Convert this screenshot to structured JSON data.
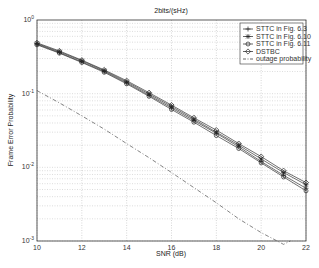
{
  "chart_data": {
    "type": "line",
    "title": "2bits/(sHz)",
    "xlabel": "SNR (dB)",
    "ylabel": "Frame Error Probability",
    "yscale": "log",
    "xlim": [
      10,
      22
    ],
    "ylim": [
      0.001,
      1
    ],
    "grid": true,
    "legend_position": "upper right",
    "x_ticks": [
      "10",
      "12",
      "14",
      "16",
      "18",
      "20",
      "22"
    ],
    "y_ticks": [
      "10^0",
      "10^-1",
      "10^-2",
      "10^-3"
    ],
    "x": [
      10,
      11,
      12,
      13,
      14,
      15,
      16,
      17,
      18,
      19,
      20,
      21,
      22
    ],
    "series": [
      {
        "name": "STTC in Fig. 6.3",
        "marker": "plus",
        "style": "solid",
        "values": [
          0.47,
          0.36,
          0.27,
          0.2,
          0.14,
          0.095,
          0.064,
          0.043,
          0.029,
          0.019,
          0.012,
          0.0078,
          0.0052
        ]
      },
      {
        "name": "STTC in Fig. 6.10",
        "marker": "star",
        "style": "solid",
        "values": [
          0.48,
          0.37,
          0.28,
          0.205,
          0.145,
          0.099,
          0.067,
          0.045,
          0.03,
          0.02,
          0.013,
          0.0085,
          0.0058
        ]
      },
      {
        "name": "STTC in Fig. 6.11",
        "marker": "circle",
        "style": "solid",
        "values": [
          0.46,
          0.355,
          0.265,
          0.195,
          0.136,
          0.092,
          0.061,
          0.041,
          0.027,
          0.018,
          0.0115,
          0.0074,
          0.0048
        ]
      },
      {
        "name": "DSTBC",
        "marker": "diamond",
        "style": "solid",
        "values": [
          0.49,
          0.38,
          0.285,
          0.21,
          0.15,
          0.103,
          0.07,
          0.047,
          0.032,
          0.021,
          0.014,
          0.009,
          0.0062
        ]
      },
      {
        "name": "outage probability",
        "marker": "none",
        "style": "dashdot",
        "values": [
          0.11,
          0.075,
          0.05,
          0.033,
          0.021,
          0.0135,
          0.0085,
          0.0053,
          0.0033,
          0.002,
          0.0013,
          0.0009,
          null
        ]
      }
    ]
  }
}
